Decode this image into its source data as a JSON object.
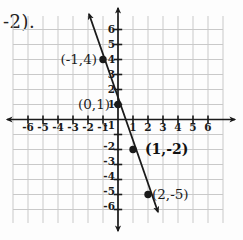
{
  "corner_text": "-2).",
  "colors": {
    "ink": "#1a1a1a",
    "grid_line": "#c9c9c9",
    "background": "#fdfdfd"
  },
  "chart_data": {
    "type": "line",
    "title": "",
    "xlabel": "",
    "ylabel": "",
    "xlim": [
      -7,
      7
    ],
    "ylim": [
      -7,
      7
    ],
    "grid": true,
    "x_ticks": [
      -6,
      -5,
      -4,
      -3,
      -2,
      -1,
      1,
      2,
      3,
      4,
      5,
      6
    ],
    "y_ticks": [
      6,
      5,
      4,
      3,
      2,
      1,
      -1,
      -2,
      -3,
      -4,
      -5,
      -6
    ],
    "line": {
      "slope": -3,
      "y_intercept": 1,
      "arrows_both_ends": true
    },
    "points": [
      {
        "x": -1,
        "y": 4,
        "label": "(-1,4)",
        "bold": false,
        "side": "left",
        "gap": 6
      },
      {
        "x": 0,
        "y": 1,
        "label": "(0,1)",
        "bold": false,
        "side": "left",
        "gap": 8
      },
      {
        "x": 1,
        "y": -2,
        "label": "(1,-2)",
        "bold": true,
        "side": "right",
        "gap": 12
      },
      {
        "x": 2,
        "y": -5,
        "label": "(2,-5)",
        "bold": false,
        "side": "right",
        "gap": 4
      }
    ]
  }
}
